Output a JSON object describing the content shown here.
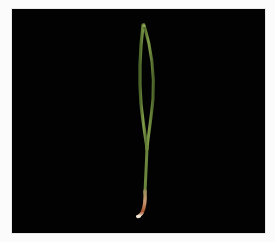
{
  "image": {
    "subject": "grass seedling with two narrow leaves on black background",
    "alt": "Grass seedling photographed against a black background",
    "colors": {
      "background": "#020202",
      "border": "#fbfbfb",
      "leaf": "#5e7a35",
      "leaf_highlight": "#8aa252",
      "root": "#b0734a",
      "root_tip": "#e8d7c4"
    }
  }
}
